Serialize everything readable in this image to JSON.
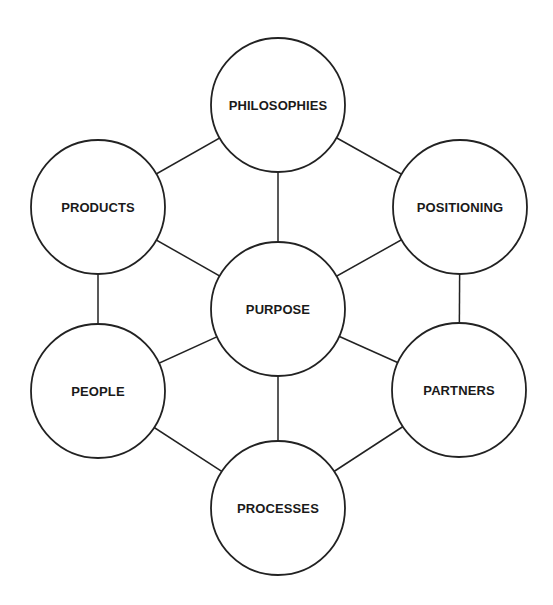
{
  "diagram": {
    "title": "",
    "center_node": "purpose",
    "nodes": [
      {
        "id": "philosophies",
        "label": "PHILOSOPHIES",
        "cx": 278,
        "cy": 105,
        "r": 67
      },
      {
        "id": "products",
        "label": "PRODUCTS",
        "cx": 98,
        "cy": 207,
        "r": 67
      },
      {
        "id": "positioning",
        "label": "POSITIONING",
        "cx": 460,
        "cy": 207,
        "r": 67
      },
      {
        "id": "purpose",
        "label": "PURPOSE",
        "cx": 278,
        "cy": 309,
        "r": 67
      },
      {
        "id": "people",
        "label": "PEOPLE",
        "cx": 98,
        "cy": 391,
        "r": 67
      },
      {
        "id": "partners",
        "label": "PARTNERS",
        "cx": 459,
        "cy": 390,
        "r": 67
      },
      {
        "id": "processes",
        "label": "PROCESSES",
        "cx": 278,
        "cy": 508,
        "r": 67
      }
    ],
    "edges": [
      {
        "from": "philosophies",
        "to": "products"
      },
      {
        "from": "philosophies",
        "to": "positioning"
      },
      {
        "from": "products",
        "to": "people"
      },
      {
        "from": "positioning",
        "to": "partners"
      },
      {
        "from": "people",
        "to": "processes"
      },
      {
        "from": "partners",
        "to": "processes"
      },
      {
        "from": "purpose",
        "to": "philosophies"
      },
      {
        "from": "purpose",
        "to": "products"
      },
      {
        "from": "purpose",
        "to": "positioning"
      },
      {
        "from": "purpose",
        "to": "people"
      },
      {
        "from": "purpose",
        "to": "partners"
      },
      {
        "from": "purpose",
        "to": "processes"
      }
    ],
    "colors": {
      "stroke": "#222222",
      "fill": "#ffffff",
      "text": "#1a1a1a",
      "background": "#ffffff"
    }
  }
}
